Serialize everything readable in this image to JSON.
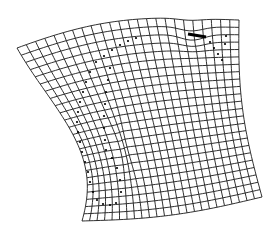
{
  "diagram": {
    "type": "deformed-grid",
    "grid": {
      "rows": 24,
      "cols": 24,
      "line_color": "#1a1a1a",
      "corners": {
        "top_left": [
          17,
          48
        ],
        "top_right": [
          239,
          20
        ],
        "bottom_right": [
          262,
          197
        ],
        "bottom_left": [
          82,
          221
        ]
      }
    },
    "dotted_outline": {
      "color": "#000000",
      "points": [
        [
          96,
          62
        ],
        [
          104,
          56
        ],
        [
          112,
          50
        ],
        [
          120,
          45
        ],
        [
          128,
          41
        ],
        [
          136,
          38
        ],
        [
          90,
          72
        ],
        [
          86,
          82
        ],
        [
          83,
          92
        ],
        [
          80,
          102
        ],
        [
          78,
          112
        ],
        [
          77,
          122
        ],
        [
          78,
          132
        ],
        [
          80,
          142
        ],
        [
          82,
          152
        ],
        [
          85,
          162
        ],
        [
          88,
          172
        ],
        [
          90,
          182
        ],
        [
          93,
          192
        ],
        [
          97,
          200
        ],
        [
          103,
          204
        ],
        [
          110,
          205
        ],
        [
          116,
          203
        ],
        [
          110,
          68
        ],
        [
          108,
          80
        ],
        [
          106,
          92
        ],
        [
          105,
          104
        ],
        [
          104,
          116
        ],
        [
          104,
          128
        ],
        [
          105,
          140
        ],
        [
          106,
          150
        ],
        [
          112,
          158
        ],
        [
          117,
          168
        ],
        [
          120,
          180
        ],
        [
          121,
          192
        ],
        [
          210,
          42
        ],
        [
          214,
          48
        ],
        [
          218,
          54
        ],
        [
          222,
          60
        ],
        [
          226,
          36
        ],
        [
          225,
          44
        ]
      ]
    },
    "dark_mark": {
      "x1": 188,
      "y1": 34,
      "x2": 206,
      "y2": 37
    }
  }
}
